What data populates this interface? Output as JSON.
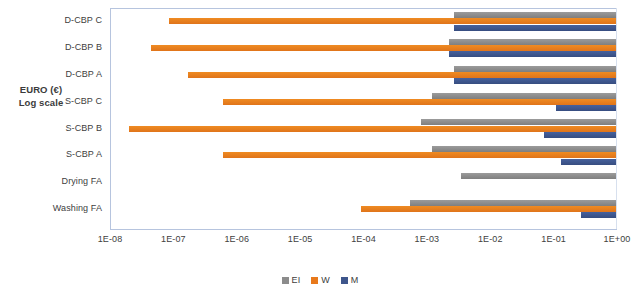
{
  "chart": {
    "type": "bar",
    "axis_title_line1": "EURO (€)",
    "axis_title_line2": "Log scale"
  },
  "chart_data": {
    "type": "bar",
    "orientation": "horizontal",
    "title": "",
    "xlabel": "",
    "ylabel": "EURO (€) Log scale",
    "xscale": "log",
    "xlim": [
      1e-08,
      1
    ],
    "grid": false,
    "legend_position": "bottom",
    "xticklabels": [
      "1E-08",
      "1E-07",
      "1E-06",
      "1E-05",
      "1E-04",
      "1E-03",
      "1E-02",
      "1E-01",
      "1E+00"
    ],
    "xtickvalues": [
      1e-08,
      1e-07,
      1e-06,
      1e-05,
      0.0001,
      0.001,
      0.01,
      0.1,
      1
    ],
    "categories": [
      "D-CBP C",
      "D-CBP B",
      "D-CBP A",
      "S-CBP C",
      "S-CBP B",
      "S-CBP A",
      "Drying FA",
      "Washing FA"
    ],
    "series": [
      {
        "name": "EI",
        "color": "#8c8c8c",
        "ranges": [
          [
            0.0027,
            1.0
          ],
          [
            0.0022,
            1.0
          ],
          [
            0.0027,
            1.0
          ],
          [
            0.0012,
            1.0
          ],
          [
            0.0008,
            1.0
          ],
          [
            0.0012,
            1.0
          ],
          [
            0.0035,
            1.0
          ],
          [
            0.00055,
            1.0
          ]
        ]
      },
      {
        "name": "W",
        "color": "#e8791b",
        "ranges": [
          [
            8.5e-08,
            1.0
          ],
          [
            4.5e-08,
            1.0
          ],
          [
            1.7e-07,
            1.0
          ],
          [
            6e-07,
            1.0
          ],
          [
            2e-08,
            1.0
          ],
          [
            6e-07,
            1.0
          ],
          [
            null,
            null
          ],
          [
            9e-05,
            1.0
          ]
        ]
      },
      {
        "name": "M",
        "color": "#3e568c",
        "ranges": [
          [
            0.0027,
            1.0
          ],
          [
            0.0022,
            1.0
          ],
          [
            0.0027,
            1.0
          ],
          [
            0.11,
            1.0
          ],
          [
            0.07,
            1.0
          ],
          [
            0.13,
            1.0
          ],
          [
            null,
            null
          ],
          [
            0.27,
            1.0
          ]
        ]
      }
    ]
  },
  "legend": {
    "items": [
      {
        "label": "EI",
        "color": "#8c8c8c"
      },
      {
        "label": "W",
        "color": "#e8791b"
      },
      {
        "label": "M",
        "color": "#3e568c"
      }
    ]
  }
}
